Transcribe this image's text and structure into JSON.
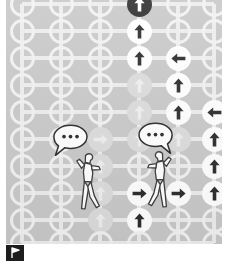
{
  "scene": {
    "title": "Grid of directional arrow nodes with two conversing figures",
    "panel_color": "#c9c9c9",
    "edge_color": "#ededed",
    "node_empty_color": "#f2f2f2",
    "node_filled_color": "#ffffff",
    "node_faded_color": "#dcdcdc",
    "arrow_dark_color": "#2b2b2b",
    "arrow_faint_color": "#efefef",
    "badge_color": "#1d1d1d"
  },
  "grid": {
    "columns": 6,
    "rows": 10,
    "column_x": [
      22,
      61,
      100,
      139,
      178,
      214
    ],
    "row_y": [
      4,
      31,
      58,
      85,
      112,
      139,
      166,
      193,
      220,
      243
    ],
    "node_diameter": 25
  },
  "nodes": [
    {
      "col": 3,
      "row": 0,
      "state": "dark",
      "arrow": "up",
      "label": "node-c3-r0-up-selected"
    },
    {
      "col": 3,
      "row": 1,
      "state": "filled",
      "arrow": "up",
      "label": "node-c3-r1-up"
    },
    {
      "col": 3,
      "row": 2,
      "state": "filled",
      "arrow": "up",
      "label": "node-c3-r2-up"
    },
    {
      "col": 4,
      "row": 2,
      "state": "filled",
      "arrow": "left",
      "label": "node-c4-r2-left"
    },
    {
      "col": 3,
      "row": 3,
      "state": "faded",
      "arrow": "up",
      "label": "node-c3-r3-up-faded"
    },
    {
      "col": 4,
      "row": 3,
      "state": "filled",
      "arrow": "up",
      "label": "node-c4-r3-up"
    },
    {
      "col": 3,
      "row": 4,
      "state": "faded",
      "arrow": "up",
      "label": "node-c3-r4-up-faded"
    },
    {
      "col": 4,
      "row": 4,
      "state": "filled",
      "arrow": "up",
      "label": "node-c4-r4-up"
    },
    {
      "col": 5,
      "row": 4,
      "state": "filled",
      "arrow": "left",
      "label": "node-c5-r4-left"
    },
    {
      "col": 2,
      "row": 5,
      "state": "faded",
      "arrow": "right",
      "label": "node-c2-r5-right-faded"
    },
    {
      "col": 3,
      "row": 5,
      "state": "faded",
      "arrow": "up",
      "label": "node-c3-r5-up-faded"
    },
    {
      "col": 4,
      "row": 5,
      "state": "faded",
      "arrow": "up",
      "label": "node-c4-r5-up-faded"
    },
    {
      "col": 5,
      "row": 5,
      "state": "filled",
      "arrow": "up",
      "label": "node-c5-r5-up"
    },
    {
      "col": 2,
      "row": 6,
      "state": "faded",
      "arrow": "up",
      "label": "node-c2-r6-up-faded"
    },
    {
      "col": 5,
      "row": 6,
      "state": "filled",
      "arrow": "up",
      "label": "node-c5-r6-up"
    },
    {
      "col": 2,
      "row": 7,
      "state": "faded",
      "arrow": "up",
      "label": "node-c2-r7-up-faded"
    },
    {
      "col": 3,
      "row": 7,
      "state": "filled",
      "arrow": "right",
      "label": "node-c3-r7-right"
    },
    {
      "col": 4,
      "row": 7,
      "state": "filled",
      "arrow": "right",
      "label": "node-c4-r7-right"
    },
    {
      "col": 5,
      "row": 7,
      "state": "filled",
      "arrow": "up",
      "label": "node-c5-r7-up"
    },
    {
      "col": 2,
      "row": 8,
      "state": "faded",
      "arrow": "up",
      "label": "node-c2-r8-up-faded"
    },
    {
      "col": 3,
      "row": 8,
      "state": "filled",
      "arrow": "up",
      "label": "node-c3-r8-up"
    }
  ],
  "actors": [
    {
      "id": "left-figure",
      "name": "figure-left",
      "x": 62,
      "y": 140,
      "bubble_text": "...",
      "bubble_name": "speech-bubble-left"
    },
    {
      "id": "right-figure",
      "name": "figure-right",
      "x": 130,
      "y": 138,
      "bubble_text": "...",
      "bubble_name": "speech-bubble-right"
    }
  ],
  "badge": {
    "name": "corner-badge",
    "glyph": "flag-icon",
    "color": "#1d1d1d"
  }
}
